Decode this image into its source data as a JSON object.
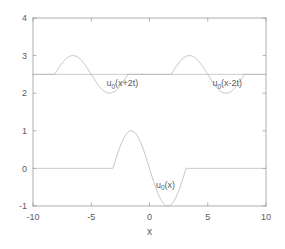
{
  "chart_data": {
    "type": "line",
    "title": "",
    "xlabel": "x",
    "ylabel": "",
    "xlim": [
      -10,
      10
    ],
    "ylim": [
      -1,
      4
    ],
    "grid": false,
    "legend": "none",
    "xticks": [
      -10,
      -5,
      0,
      5,
      10
    ],
    "xticklabels": [
      "-10",
      "-5",
      "0",
      "5",
      "10"
    ],
    "yticks": [
      -1,
      0,
      1,
      2,
      3,
      4
    ],
    "yticklabels": [
      "-1",
      "0",
      "1",
      "2",
      "3",
      "4"
    ],
    "line_color": "#b5b5b5",
    "axis_color": "#9a9a9a",
    "text_color": "#5a5a5a",
    "background": "#ffffff",
    "annotations": [
      {
        "name": "label-u0-x-plus-2t",
        "base": "u",
        "sub": "0",
        "rest": "(x+2t)",
        "x": -3.7,
        "y": 2.18
      },
      {
        "name": "label-u0-x-minus-2t",
        "base": "u",
        "sub": "0",
        "rest": "(x-2t)",
        "x": 5.4,
        "y": 2.18
      },
      {
        "name": "label-u0-x",
        "base": "u",
        "sub": "0",
        "rest": "(x)",
        "x": 0.55,
        "y": -0.52
      }
    ],
    "series": [
      {
        "name": "u0(x)",
        "description": "Initial profile: zero outside [-pi, pi], -sin(x) shaped bump with trough -1 near x=-1.57 and crest +1 near x=1.57",
        "baseline": 0,
        "amplitude": 1,
        "center": 0,
        "half_width": 3.14159,
        "sign": -1
      },
      {
        "name": "u0(x+2t)",
        "description": "Left-travelling half-wave shifted up by 2.5, centered at x=-5, amplitude 0.5",
        "baseline": 2.5,
        "amplitude": 0.5,
        "center": -5,
        "half_width": 3.14159,
        "sign": -1
      },
      {
        "name": "u0(x-2t)",
        "description": "Right-travelling half-wave shifted up by 2.5, centered at x=5, amplitude 0.5",
        "baseline": 2.5,
        "amplitude": 0.5,
        "center": 5,
        "half_width": 3.14159,
        "sign": -1
      }
    ]
  }
}
